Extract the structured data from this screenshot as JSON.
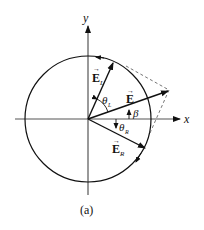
{
  "diagram": {
    "caption": "(a)",
    "axes": {
      "x_label": "x",
      "y_label": "y"
    },
    "vectors": {
      "E": {
        "label": "E",
        "arrow_mark": "→"
      },
      "E_L": {
        "label": "E",
        "subscript": "L",
        "arrow_mark": "→"
      },
      "E_R": {
        "label": "E",
        "subscript": "R",
        "arrow_mark": "→"
      }
    },
    "angles": {
      "theta_L": {
        "symbol": "θ",
        "subscript": "L"
      },
      "theta_R": {
        "symbol": "θ",
        "subscript": "R"
      },
      "beta": {
        "symbol": "β"
      }
    },
    "colors": {
      "line": "#111111",
      "axis": "#555555",
      "dashed": "#666666"
    }
  }
}
